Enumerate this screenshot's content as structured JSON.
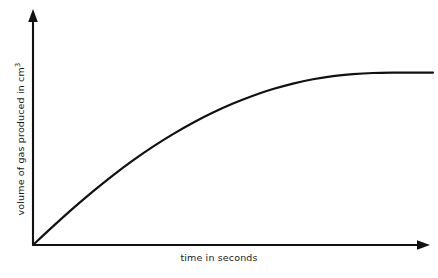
{
  "figure": {
    "background_color": "#ffffff",
    "line_color": "#111111",
    "axis_color": "#111111"
  },
  "axes": {
    "x_label_text": "time in seconds",
    "y_label_text_main": "volume of gas produced in cm",
    "y_label_text_sup": "3",
    "y_label_full": "volume of gas produced in cm3",
    "x_arrow_name": "x-axis-arrowhead",
    "y_arrow_name": "y-axis-arrowhead",
    "ticks_shown": "none",
    "gridlines_shown": "none",
    "tick_labels": []
  },
  "chart_data": {
    "type": "line",
    "title": "",
    "subtitle": "",
    "xlabel": "time in seconds",
    "ylabel": "volume of gas produced in cm3",
    "xlim": [
      0,
      100
    ],
    "ylim": [
      0,
      100
    ],
    "grid": false,
    "legend": false,
    "legend_position": "none",
    "axis_arrows": true,
    "tick_labels_x": [],
    "tick_labels_y": [],
    "annotations": [],
    "series": [
      {
        "name": "volume of gas produced",
        "color": "#111111",
        "line_width": 2.2,
        "x": [
          0,
          5,
          10,
          15,
          20,
          25,
          30,
          35,
          40,
          45,
          50,
          55,
          60,
          65,
          70,
          75,
          80,
          85,
          90,
          95,
          100
        ],
        "y": [
          0,
          9.5,
          18.7,
          27.4,
          35.6,
          43.2,
          50.2,
          56.6,
          62.4,
          67.6,
          72.2,
          76.2,
          79.6,
          82.4,
          84.6,
          86.2,
          87.2,
          87.8,
          88.0,
          88.0,
          88.0
        ]
      }
    ]
  }
}
